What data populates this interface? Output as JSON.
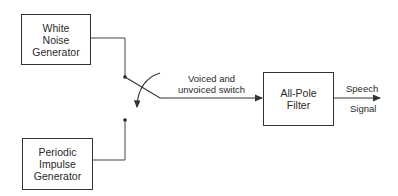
{
  "diagram": {
    "blocks": {
      "white_noise": {
        "lines": [
          "White",
          "Noise",
          "Generator"
        ]
      },
      "periodic_impulse": {
        "lines": [
          "Periodic",
          "Impulse",
          "Generator"
        ]
      },
      "all_pole_filter": {
        "lines": [
          "All-Pole",
          "Filter"
        ]
      }
    },
    "switch": {
      "lines": [
        "Voiced and",
        "unvoiced switch"
      ]
    },
    "output": {
      "top": "Speech",
      "bottom": "Signal"
    },
    "colors": {
      "line": "#333333",
      "background": "#ffffff"
    }
  }
}
